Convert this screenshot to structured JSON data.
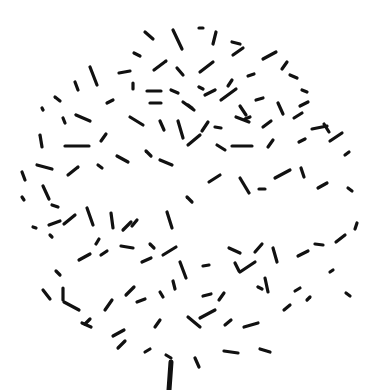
{
  "image": {
    "description": "dandelion-like cluster of short black dashes on a white background with a vertical stem",
    "background": "#ffffff",
    "ink": "#111111",
    "width": 392,
    "height": 390
  },
  "stem": {
    "x1": 171,
    "y1": 362,
    "x2": 169,
    "y2": 390,
    "width": 5
  },
  "dashes": [
    [
      145,
      32,
      153,
      39
    ],
    [
      173,
      30,
      182,
      49
    ],
    [
      199,
      28,
      203,
      28
    ],
    [
      216,
      32,
      213,
      44
    ],
    [
      232,
      42,
      240,
      44
    ],
    [
      134,
      53,
      140,
      56
    ],
    [
      119,
      73,
      130,
      71
    ],
    [
      154,
      70,
      166,
      61
    ],
    [
      177,
      68,
      183,
      75
    ],
    [
      200,
      72,
      213,
      62
    ],
    [
      233,
      55,
      243,
      48
    ],
    [
      263,
      59,
      276,
      52
    ],
    [
      90,
      67,
      97,
      85
    ],
    [
      75,
      82,
      78,
      90
    ],
    [
      55,
      97,
      60,
      101
    ],
    [
      133,
      83,
      133,
      89
    ],
    [
      147,
      91,
      161,
      91
    ],
    [
      171,
      90,
      178,
      93
    ],
    [
      199,
      87,
      203,
      89
    ],
    [
      228,
      86,
      232,
      80
    ],
    [
      248,
      76,
      254,
      74
    ],
    [
      282,
      69,
      287,
      62
    ],
    [
      290,
      75,
      297,
      78
    ],
    [
      302,
      90,
      307,
      92
    ],
    [
      42,
      108,
      43,
      110
    ],
    [
      63,
      118,
      65,
      123
    ],
    [
      76,
      115,
      90,
      121
    ],
    [
      107,
      103,
      113,
      100
    ],
    [
      150,
      103,
      161,
      103
    ],
    [
      183,
      102,
      194,
      110
    ],
    [
      188,
      105,
      192,
      108
    ],
    [
      205,
      95,
      215,
      90
    ],
    [
      221,
      100,
      236,
      89
    ],
    [
      240,
      106,
      246,
      115
    ],
    [
      256,
      100,
      263,
      98
    ],
    [
      278,
      103,
      283,
      114
    ],
    [
      300,
      106,
      308,
      102
    ],
    [
      324,
      124,
      329,
      132
    ],
    [
      40,
      135,
      42,
      147
    ],
    [
      65,
      146,
      89,
      146
    ],
    [
      106,
      134,
      101,
      141
    ],
    [
      130,
      117,
      143,
      125
    ],
    [
      160,
      121,
      164,
      130
    ],
    [
      178,
      121,
      183,
      138
    ],
    [
      202,
      131,
      208,
      122
    ],
    [
      215,
      127,
      221,
      128
    ],
    [
      236,
      117,
      249,
      122
    ],
    [
      245,
      119,
      250,
      117
    ],
    [
      263,
      127,
      271,
      121
    ],
    [
      294,
      118,
      302,
      113
    ],
    [
      312,
      129,
      327,
      126
    ],
    [
      22,
      172,
      25,
      180
    ],
    [
      37,
      165,
      52,
      169
    ],
    [
      68,
      175,
      78,
      167
    ],
    [
      98,
      165,
      102,
      168
    ],
    [
      117,
      156,
      128,
      162
    ],
    [
      146,
      151,
      151,
      156
    ],
    [
      160,
      160,
      172,
      165
    ],
    [
      188,
      145,
      200,
      135
    ],
    [
      217,
      145,
      225,
      150
    ],
    [
      232,
      146,
      252,
      146
    ],
    [
      268,
      147,
      273,
      140
    ],
    [
      299,
      142,
      305,
      139
    ],
    [
      330,
      141,
      342,
      133
    ],
    [
      345,
      155,
      349,
      152
    ],
    [
      22,
      197,
      24,
      200
    ],
    [
      43,
      186,
      49,
      199
    ],
    [
      52,
      205,
      58,
      207
    ],
    [
      49,
      225,
      60,
      221
    ],
    [
      33,
      227,
      36,
      228
    ],
    [
      64,
      224,
      75,
      215
    ],
    [
      87,
      208,
      93,
      225
    ],
    [
      96,
      244,
      99,
      239
    ],
    [
      111,
      213,
      113,
      228
    ],
    [
      137,
      220,
      132,
      226
    ],
    [
      123,
      230,
      131,
      222
    ],
    [
      150,
      244,
      154,
      248
    ],
    [
      167,
      212,
      172,
      228
    ],
    [
      187,
      197,
      192,
      202
    ],
    [
      209,
      182,
      220,
      175
    ],
    [
      240,
      178,
      249,
      193
    ],
    [
      259,
      189,
      265,
      189
    ],
    [
      275,
      178,
      290,
      170
    ],
    [
      301,
      168,
      304,
      177
    ],
    [
      318,
      188,
      327,
      183
    ],
    [
      348,
      188,
      352,
      191
    ],
    [
      50,
      235,
      52,
      237
    ],
    [
      56,
      271,
      60,
      275
    ],
    [
      63,
      288,
      63,
      300
    ],
    [
      79,
      260,
      90,
      254
    ],
    [
      101,
      255,
      107,
      251
    ],
    [
      121,
      246,
      133,
      248
    ],
    [
      142,
      262,
      151,
      258
    ],
    [
      163,
      255,
      176,
      247
    ],
    [
      180,
      262,
      186,
      278
    ],
    [
      203,
      266,
      209,
      265
    ],
    [
      229,
      248,
      240,
      253
    ],
    [
      235,
      263,
      239,
      271
    ],
    [
      255,
      252,
      262,
      244
    ],
    [
      273,
      248,
      277,
      262
    ],
    [
      298,
      256,
      308,
      251
    ],
    [
      315,
      244,
      323,
      245
    ],
    [
      336,
      242,
      345,
      235
    ],
    [
      357,
      223,
      355,
      229
    ],
    [
      43,
      290,
      50,
      299
    ],
    [
      64,
      302,
      79,
      310
    ],
    [
      85,
      324,
      90,
      319
    ],
    [
      105,
      310,
      112,
      300
    ],
    [
      126,
      295,
      134,
      287
    ],
    [
      137,
      302,
      145,
      299
    ],
    [
      160,
      292,
      163,
      297
    ],
    [
      173,
      281,
      175,
      289
    ],
    [
      203,
      296,
      211,
      294
    ],
    [
      219,
      300,
      224,
      293
    ],
    [
      240,
      272,
      255,
      262
    ],
    [
      258,
      287,
      262,
      289
    ],
    [
      265,
      278,
      268,
      292
    ],
    [
      295,
      291,
      300,
      288
    ],
    [
      330,
      272,
      333,
      270
    ],
    [
      346,
      293,
      350,
      296
    ],
    [
      82,
      323,
      91,
      327
    ],
    [
      113,
      336,
      124,
      330
    ],
    [
      155,
      327,
      160,
      320
    ],
    [
      188,
      317,
      200,
      327
    ],
    [
      200,
      318,
      215,
      310
    ],
    [
      225,
      325,
      231,
      320
    ],
    [
      244,
      327,
      258,
      323
    ],
    [
      284,
      310,
      290,
      305
    ],
    [
      307,
      300,
      310,
      297
    ],
    [
      118,
      348,
      125,
      341
    ],
    [
      145,
      352,
      150,
      349
    ],
    [
      166,
      355,
      171,
      358
    ],
    [
      195,
      358,
      199,
      367
    ],
    [
      224,
      351,
      238,
      353
    ],
    [
      260,
      349,
      270,
      352
    ]
  ]
}
